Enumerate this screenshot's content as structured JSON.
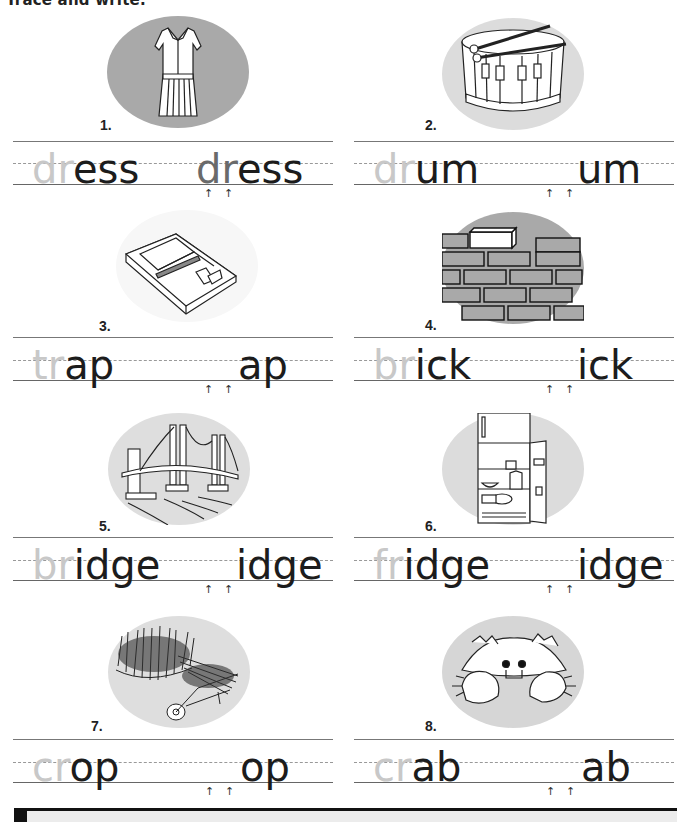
{
  "page": {
    "title": "Trace and write.",
    "arrow_glyph": "↑"
  },
  "items": [
    {
      "number": "1.",
      "picture": "dress",
      "prefix": "dr",
      "rest": "ess",
      "answer_prefix": "dr",
      "answer_rest": "ess",
      "ellipse_color": "#a9a9a9"
    },
    {
      "number": "2.",
      "picture": "drum",
      "prefix": "dr",
      "rest": "um",
      "answer_prefix": "",
      "answer_rest": "um",
      "ellipse_color": "#dcdcdc"
    },
    {
      "number": "3.",
      "picture": "mousetrap",
      "prefix": "tr",
      "rest": "ap",
      "answer_prefix": "",
      "answer_rest": "ap",
      "ellipse_color": "#f7f7f7"
    },
    {
      "number": "4.",
      "picture": "brick-wall",
      "prefix": "br",
      "rest": "ick",
      "answer_prefix": "",
      "answer_rest": "ick",
      "ellipse_color": "#a9a9a9"
    },
    {
      "number": "5.",
      "picture": "bridge",
      "prefix": "br",
      "rest": "idge",
      "answer_prefix": "",
      "answer_rest": "idge",
      "ellipse_color": "#dedede"
    },
    {
      "number": "6.",
      "picture": "refrigerator",
      "prefix": "fr",
      "rest": "idge",
      "answer_prefix": "",
      "answer_rest": "idge",
      "ellipse_color": "#dcdcdc"
    },
    {
      "number": "7.",
      "picture": "crop-wheelbarrow",
      "prefix": "cr",
      "rest": "op",
      "answer_prefix": "",
      "answer_rest": "op",
      "ellipse_color": "#dedede"
    },
    {
      "number": "8.",
      "picture": "crab",
      "prefix": "cr",
      "rest": "ab",
      "answer_prefix": "",
      "answer_rest": "ab",
      "ellipse_color": "#d6d6d6"
    }
  ]
}
